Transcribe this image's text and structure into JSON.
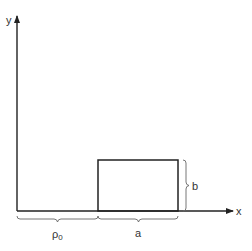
{
  "diagram": {
    "axes": {
      "x_label": "x",
      "y_label": "y"
    },
    "rectangle": {
      "width_label": "a",
      "height_label": "b"
    },
    "offset_label": "ρ",
    "offset_subscript": "0",
    "colors": {
      "stroke": "#222222",
      "brace": "#555555",
      "text": "#333333"
    }
  }
}
